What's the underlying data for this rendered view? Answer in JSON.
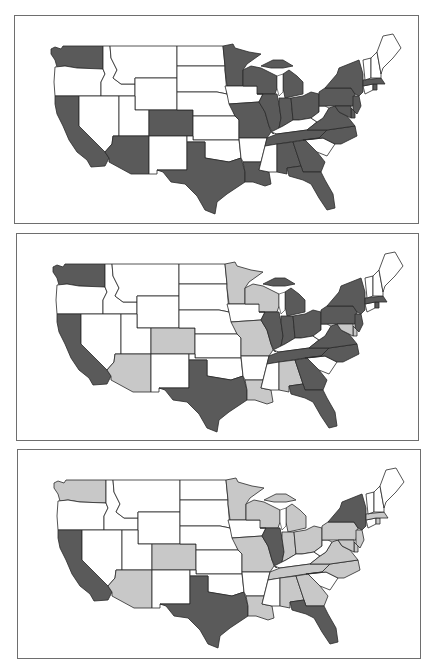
{
  "figure": {
    "panel_count": 3,
    "map_type": "choropleth",
    "region": "Contiguous United States",
    "legend_classes": [
      {
        "class": 0,
        "color": "#ffffff",
        "description": "unshaded"
      },
      {
        "class": 1,
        "color": "#c8c8c8",
        "description": "light gray"
      },
      {
        "class": 2,
        "color": "#5a5a5a",
        "description": "dark gray"
      }
    ]
  },
  "panels": [
    {
      "id": "panel-1",
      "dark_states": [
        "WA",
        "CA",
        "AZ",
        "CO",
        "TX",
        "MN",
        "WI",
        "MI",
        "IL",
        "IN",
        "OH",
        "MO",
        "LA",
        "TN",
        "AL",
        "GA",
        "FL",
        "NC",
        "VA",
        "PA",
        "NY",
        "NJ",
        "MD",
        "DE",
        "MA",
        "RI"
      ],
      "light_states": []
    },
    {
      "id": "panel-2",
      "dark_states": [
        "WA",
        "CA",
        "TX",
        "MI",
        "IL",
        "IN",
        "OH",
        "TN",
        "GA",
        "FL",
        "NC",
        "VA",
        "PA",
        "NY",
        "NJ",
        "MA",
        "RI"
      ],
      "light_states": [
        "MN",
        "WI",
        "CO",
        "AZ",
        "MO",
        "LA",
        "AL",
        "MD",
        "DE"
      ]
    },
    {
      "id": "panel-3",
      "dark_states": [
        "CA",
        "TX",
        "IL",
        "NY",
        "FL"
      ],
      "light_states": [
        "WA",
        "MN",
        "WI",
        "MI",
        "CO",
        "AZ",
        "MO",
        "IN",
        "OH",
        "PA",
        "VA",
        "NC",
        "TN",
        "AL",
        "GA",
        "LA",
        "NJ",
        "MD",
        "DE",
        "MA",
        "RI"
      ]
    }
  ]
}
